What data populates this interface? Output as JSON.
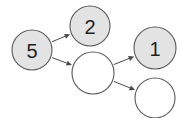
{
  "canvas": {
    "width": 182,
    "height": 118,
    "background": "#ffffff"
  },
  "style": {
    "node_fill_filled": "#e3e3e3",
    "node_fill_empty": "#ffffff",
    "node_stroke": "#595959",
    "node_stroke_width": 1.1,
    "edge_stroke": "#4a4a4a",
    "edge_stroke_width": 1,
    "label_color": "#1f1f1f",
    "label_font_size": 20
  },
  "chart_data": {
    "type": "diagram",
    "subtype": "directed-graph",
    "title": "",
    "nodes": [
      {
        "id": "n5",
        "label": "5",
        "cx": 32,
        "cy": 50,
        "r": 20,
        "filled": true
      },
      {
        "id": "n2",
        "label": "2",
        "cx": 90,
        "cy": 26,
        "r": 20,
        "filled": true
      },
      {
        "id": "nm",
        "label": "",
        "cx": 93,
        "cy": 73,
        "r": 21,
        "filled": false
      },
      {
        "id": "n1",
        "label": "1",
        "cx": 155,
        "cy": 48,
        "r": 21,
        "filled": true
      },
      {
        "id": "nb",
        "label": "",
        "cx": 155,
        "cy": 98,
        "r": 20,
        "filled": false
      }
    ],
    "edges": [
      {
        "id": "e1",
        "from": "n5",
        "to": "n2",
        "directed": true
      },
      {
        "id": "e2",
        "from": "n5",
        "to": "nm",
        "directed": true
      },
      {
        "id": "e3",
        "from": "nm",
        "to": "n1",
        "directed": true
      },
      {
        "id": "e4",
        "from": "nm",
        "to": "nb",
        "directed": true
      }
    ],
    "node_count": 5,
    "edge_count": 4,
    "labels_shown": [
      "5",
      "2",
      "1"
    ]
  }
}
